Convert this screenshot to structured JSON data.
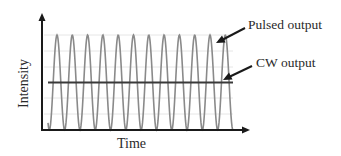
{
  "chart_data": {
    "type": "line",
    "title": "",
    "xlabel": "Time",
    "ylabel": "Intensity",
    "grid": true,
    "axis_ticks": false,
    "series": [
      {
        "name": "Pulsed output",
        "shape": "periodic pulses (sinusoidal, oscillating between 0 and peak)",
        "num_peaks": 11,
        "min": 0,
        "max": 1.0,
        "color": "#8a8a8a"
      },
      {
        "name": "CW output",
        "shape": "constant",
        "value": 0.5,
        "color": "#3a3a3a"
      }
    ],
    "annotations": [
      {
        "text": "Pulsed output",
        "points_to": "peaks of pulsed output"
      },
      {
        "text": "CW output",
        "points_to": "constant CW line"
      }
    ],
    "legend": "arrow annotations on right"
  },
  "labels": {
    "xlabel": "Time",
    "ylabel": "Intensity",
    "pulsed": "Pulsed output",
    "cw": "CW output"
  },
  "colors": {
    "axis": "#1a1a1a",
    "pulse": "#8a8a8a",
    "cw": "#3a3a3a",
    "grid": "#e6e6e6"
  }
}
